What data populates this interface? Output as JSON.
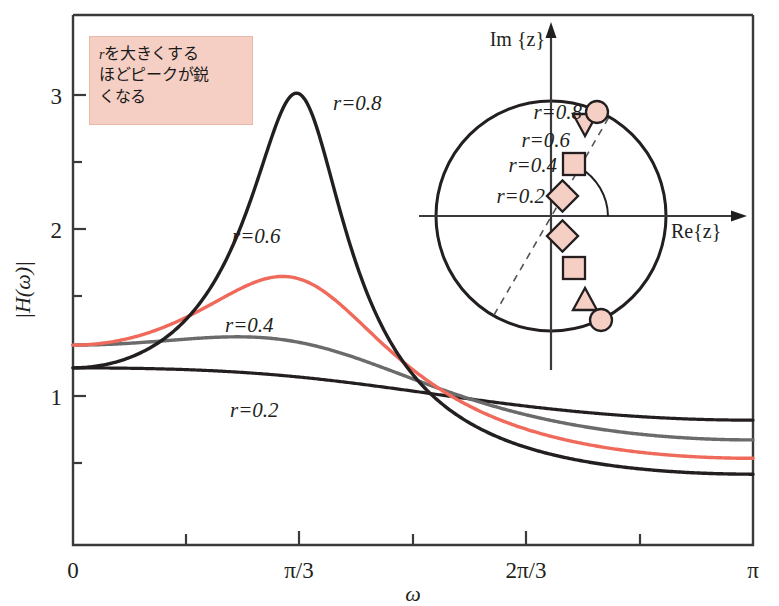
{
  "figure": {
    "annotation": {
      "text_r": "r",
      "line1": "を大きくする",
      "line2": "ほどピークが鋭",
      "line3": "くなる",
      "box_color": "#f6cfc4"
    },
    "axes": {
      "ylabel": "|H(ω)|",
      "xlabel": "ω",
      "x_ticks": [
        "0",
        "π/3",
        "2π/3",
        "π"
      ],
      "y_ticks": [
        "1",
        "2",
        "3"
      ]
    },
    "series_labels": {
      "r08": "r=0.8",
      "r06": "r=0.6",
      "r04": "r=0.4",
      "r02": "r=0.2"
    },
    "inset": {
      "im_axis": "Im {z}",
      "re_axis": "Re{z}",
      "pole_labels": {
        "r08": "r=0.8",
        "r06": "r=0.6",
        "r04": "r=0.4",
        "r02": "r=0.2"
      }
    }
  },
  "chart_data": {
    "type": "line",
    "title": "",
    "xlabel": "ω",
    "ylabel": "|H(ω)|",
    "xlim": [
      0,
      3.14159
    ],
    "ylim": [
      0,
      3.6
    ],
    "x_tick_values": [
      0,
      1.0472,
      2.0944,
      3.14159
    ],
    "x_tick_labels": [
      "0",
      "π/3",
      "2π/3",
      "π"
    ],
    "y_tick_values": [
      1,
      2,
      3
    ],
    "y_tick_labels": [
      "1",
      "2",
      "3"
    ],
    "y_minor_ticks": [
      0.5,
      1.5,
      2.5
    ],
    "grid": false,
    "legend": "inline-labels",
    "pole_angle": 1.0472,
    "series": [
      {
        "name": "r=0.8",
        "color": "#231f20",
        "r": 0.8,
        "peak": {
          "x": 1.0472,
          "y": 3.48
        },
        "values_at": {
          "0": 1.21,
          "1.0472": 3.48,
          "2.0944": 0.92,
          "3.14159": 0.44
        }
      },
      {
        "name": "r=0.6",
        "color": "#ef6a5a",
        "r": 0.6,
        "peak": {
          "x": 1.0472,
          "y": 1.8
        },
        "values_at": {
          "0": 1.38,
          "1.0472": 1.8,
          "2.0944": 0.95,
          "3.14159": 0.54
        }
      },
      {
        "name": "r=0.4",
        "color": "#595959",
        "r": 0.4,
        "peak": {
          "x": 0.92,
          "y": 1.36
        },
        "values_at": {
          "0": 1.38,
          "1.0472": 1.35,
          "2.0944": 0.97,
          "3.14159": 0.61
        }
      },
      {
        "name": "r=0.2",
        "color": "#231f20",
        "r": 0.2,
        "peak": {
          "x": 0.45,
          "y": 1.22
        },
        "values_at": {
          "0": 1.21,
          "1.0472": 1.17,
          "2.0944": 1.0,
          "3.14159": 0.82
        }
      }
    ],
    "inset_chart": {
      "type": "scatter",
      "description": "z-plane pole plot, unit circle",
      "unit_circle_radius": 1.0,
      "angle_marked": "π/3",
      "poles": [
        {
          "label": "r=0.2",
          "marker": "diamond",
          "r": 0.2,
          "angle": 1.0472
        },
        {
          "label": "r=0.4",
          "marker": "square",
          "r": 0.4,
          "angle": 1.0472
        },
        {
          "label": "r=0.6",
          "marker": "triangle",
          "r": 0.6,
          "angle": 1.0472
        },
        {
          "label": "r=0.8",
          "marker": "circle",
          "r": 0.8,
          "angle": 1.0472
        },
        {
          "label": "r=0.2",
          "marker": "diamond",
          "r": 0.2,
          "angle": -1.0472
        },
        {
          "label": "r=0.4",
          "marker": "square",
          "r": 0.4,
          "angle": -1.0472
        },
        {
          "label": "r=0.6",
          "marker": "triangle",
          "r": 0.6,
          "angle": -1.0472
        },
        {
          "label": "r=0.8",
          "marker": "circle",
          "r": 0.8,
          "angle": -1.0472
        }
      ],
      "marker_fill": "#f6cfc4",
      "marker_stroke": "#231f20"
    }
  }
}
